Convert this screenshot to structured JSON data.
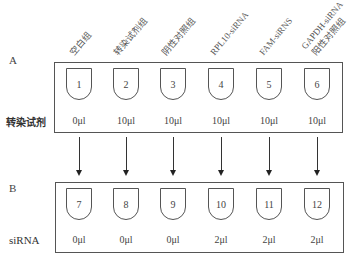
{
  "panel_a": {
    "letter": "A",
    "row_label": "转染试剂",
    "columns": [
      {
        "label": "空白组",
        "tube": "1",
        "volume": "0μl"
      },
      {
        "label": "转染试剂组",
        "tube": "2",
        "volume": "10μl"
      },
      {
        "label": "阴性对照组",
        "tube": "3",
        "volume": "10μl"
      },
      {
        "label": "RPL10-siRNA",
        "tube": "4",
        "volume": "10μl"
      },
      {
        "label": "FAM-siRNS",
        "tube": "5",
        "volume": "10μl"
      },
      {
        "label": "GAPDH-siRNA",
        "label2": "阳性对照组",
        "tube": "6",
        "volume": "10μl"
      }
    ]
  },
  "panel_b": {
    "letter": "B",
    "row_label": "siRNA",
    "columns": [
      {
        "tube": "7",
        "volume": "0μl"
      },
      {
        "tube": "8",
        "volume": "0μl"
      },
      {
        "tube": "9",
        "volume": "0μl"
      },
      {
        "tube": "10",
        "volume": "2μl"
      },
      {
        "tube": "11",
        "volume": "2μl"
      },
      {
        "tube": "12",
        "volume": "2μl"
      }
    ]
  },
  "arrows": {
    "count": 6,
    "direction": "down"
  }
}
